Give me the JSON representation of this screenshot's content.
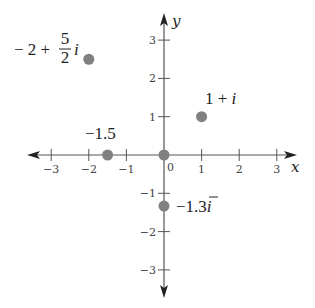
{
  "diagram": {
    "type": "complex-plane",
    "x_axis": {
      "label": "x",
      "range": [
        -3,
        3
      ],
      "ticks": [
        -3,
        -2,
        -1,
        1,
        2,
        3
      ],
      "tick_labels": [
        "−3",
        "−2",
        "−1",
        "1",
        "2",
        "3"
      ]
    },
    "y_axis": {
      "label": "y",
      "range": [
        -3,
        3
      ],
      "ticks": [
        -3,
        -2,
        -1,
        1,
        2,
        3
      ],
      "tick_labels": [
        "−3",
        "−2",
        "−1",
        "1",
        "2",
        "3"
      ]
    },
    "origin_label": "0",
    "point_color": "#808080",
    "axis_color": "#555555",
    "points": [
      {
        "re": -2,
        "im": 2.5,
        "label": "-2 + 5/2 i",
        "label_parts": {
          "pre": "− 2 + ",
          "num": "5",
          "den": "2",
          "post": "i"
        }
      },
      {
        "re": 1,
        "im": 1,
        "label": "1 + i",
        "label_parts": {
          "pre": "1 + ",
          "post": "i"
        }
      },
      {
        "re": -1.5,
        "im": 0,
        "label": "−1.5",
        "label_parts": {
          "pre": "−1.5"
        }
      },
      {
        "re": 0,
        "im": 0,
        "label": "",
        "label_parts": {}
      },
      {
        "re": 0,
        "im": -1.3333,
        "label": "−1.3̄i",
        "label_parts": {
          "pre": "−1.",
          "over": "3",
          "post": "i"
        }
      }
    ]
  }
}
